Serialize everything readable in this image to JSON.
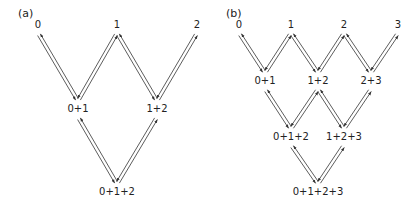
{
  "panels": [
    {
      "id": "a",
      "label": "(a)",
      "label_pos": [
        18,
        17
      ],
      "nodes": [
        {
          "id": "0",
          "text": "0",
          "x": 38,
          "y": 28
        },
        {
          "id": "1",
          "text": "1",
          "x": 117,
          "y": 28
        },
        {
          "id": "2",
          "text": "2",
          "x": 197,
          "y": 28
        },
        {
          "id": "01",
          "text": "0+1",
          "x": 78,
          "y": 112
        },
        {
          "id": "12",
          "text": "1+2",
          "x": 157,
          "y": 112
        },
        {
          "id": "012",
          "text": "0+1+2",
          "x": 117,
          "y": 195
        }
      ],
      "edges": [
        {
          "from": "0",
          "to": "01"
        },
        {
          "from": "1",
          "to": "01"
        },
        {
          "from": "1",
          "to": "12"
        },
        {
          "from": "2",
          "to": "12"
        },
        {
          "from": "01",
          "to": "012"
        },
        {
          "from": "12",
          "to": "012"
        }
      ]
    },
    {
      "id": "b",
      "label": "(b)",
      "label_pos": [
        226,
        17
      ],
      "nodes": [
        {
          "id": "0",
          "text": "0",
          "x": 239,
          "y": 28
        },
        {
          "id": "1",
          "text": "1",
          "x": 291,
          "y": 28
        },
        {
          "id": "2",
          "text": "2",
          "x": 344,
          "y": 28
        },
        {
          "id": "3",
          "text": "3",
          "x": 398,
          "y": 28
        },
        {
          "id": "01",
          "text": "0+1",
          "x": 265,
          "y": 84
        },
        {
          "id": "12",
          "text": "1+2",
          "x": 318,
          "y": 84
        },
        {
          "id": "23",
          "text": "2+3",
          "x": 371,
          "y": 84
        },
        {
          "id": "012",
          "text": "0+1+2",
          "x": 291,
          "y": 140
        },
        {
          "id": "123",
          "text": "1+2+3",
          "x": 344,
          "y": 140
        },
        {
          "id": "0123",
          "text": "0+1+2+3",
          "x": 318,
          "y": 195
        }
      ],
      "edges": [
        {
          "from": "0",
          "to": "01"
        },
        {
          "from": "1",
          "to": "01"
        },
        {
          "from": "1",
          "to": "12"
        },
        {
          "from": "2",
          "to": "12"
        },
        {
          "from": "2",
          "to": "23"
        },
        {
          "from": "3",
          "to": "23"
        },
        {
          "from": "01",
          "to": "012"
        },
        {
          "from": "12",
          "to": "012"
        },
        {
          "from": "12",
          "to": "123"
        },
        {
          "from": "23",
          "to": "123"
        },
        {
          "from": "012",
          "to": "0123"
        },
        {
          "from": "123",
          "to": "0123"
        }
      ]
    }
  ],
  "style": {
    "line_color": "#333333",
    "text_color": "#222222",
    "background": "#ffffff"
  }
}
